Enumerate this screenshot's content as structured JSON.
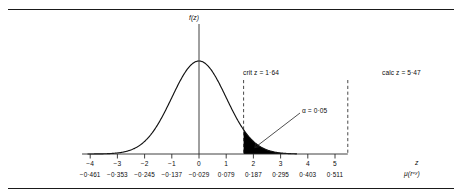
{
  "figure": {
    "ylabel": "f(z)",
    "xaxis_symbol": "z",
    "xaxis_second_symbol": "μ(rˣʸ)"
  },
  "chart_data": {
    "type": "line",
    "title": "",
    "xlabel": "z",
    "ylabel": "f(z)",
    "subtype": "normal-distribution-with-shaded-upper-tail",
    "distribution": {
      "mean": 0,
      "sd": 1,
      "curve_range": [
        -4.1,
        3.6
      ]
    },
    "xlim": [
      -4.3,
      5.6
    ],
    "ylim": [
      0,
      1.08
    ],
    "grid": false,
    "legend": null,
    "x_ticks": [
      -4,
      -3,
      -2,
      -1,
      0,
      1,
      2,
      3,
      4,
      5
    ],
    "x_tick_labels": [
      "−4",
      "−3",
      "−2",
      "−1",
      "0",
      "1",
      "2",
      "3",
      "4",
      "5"
    ],
    "secondary_axis_labels": [
      "−0·461",
      "−0·353",
      "−0·245",
      "−0·137",
      "−0·029",
      "0·079",
      "0·187",
      "0·295",
      "0·403",
      "0·511"
    ],
    "shaded_region": {
      "from": 1.64,
      "to": 3.6,
      "area": 0.05,
      "color": "#000000"
    },
    "annotations": [
      {
        "name": "crit-z",
        "text": "crit z = 1·64",
        "x": 1.64,
        "value": 1.64,
        "style": "dashed-vertical"
      },
      {
        "name": "alpha",
        "text": "α = 0·05",
        "x": 2.05,
        "value": 0.05,
        "style": "leader-label"
      },
      {
        "name": "calc-z",
        "text": "calc z = 5·47",
        "x": 5.47,
        "value": 5.47,
        "style": "dashed-vertical"
      }
    ]
  },
  "annotations": {
    "crit_z": "crit z = 1·64",
    "alpha": "α = 0·05",
    "calc_z": "calc z = 5·47"
  },
  "ticks": {
    "row1": [
      "−4",
      "−3",
      "−2",
      "−1",
      "0",
      "1",
      "2",
      "3",
      "4",
      "5"
    ],
    "row2": [
      "−0·461",
      "−0·353",
      "−0·245",
      "−0·137",
      "−0·029",
      "0·079",
      "0·187",
      "0·295",
      "0·403",
      "0·511"
    ]
  }
}
